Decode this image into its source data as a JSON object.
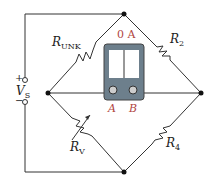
{
  "diagram": {
    "type": "wheatstone-bridge",
    "labels": {
      "r_unk": "R",
      "r_unk_sub": "UNK",
      "r2": "R",
      "r2_sub": "2",
      "rv": "R",
      "rv_sub": "V",
      "r4": "R",
      "r4_sub": "4",
      "vs": "V",
      "vs_sub": "S",
      "plus": "+",
      "minus": "−",
      "meter_reading": "0 A",
      "terminal_a": "A",
      "terminal_b": "B"
    },
    "colors": {
      "wire": "#333333",
      "meter_body": "#6d7f8c",
      "label_red": "#b0453f"
    }
  }
}
